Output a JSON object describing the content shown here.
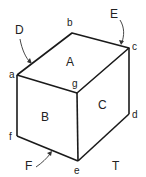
{
  "diagram": {
    "type": "isometric-box",
    "vertices": [
      {
        "id": "a",
        "label": "a",
        "x": 17,
        "y": 75
      },
      {
        "id": "b",
        "label": "b",
        "x": 72,
        "y": 33
      },
      {
        "id": "c",
        "label": "c",
        "x": 129,
        "y": 48
      },
      {
        "id": "d",
        "label": "d",
        "x": 129,
        "y": 114
      },
      {
        "id": "e",
        "label": "e",
        "x": 78,
        "y": 161
      },
      {
        "id": "f",
        "label": "f",
        "x": 17,
        "y": 136
      },
      {
        "id": "g",
        "label": "g",
        "x": 77,
        "y": 93
      }
    ],
    "faces": [
      {
        "id": "A",
        "label": "A",
        "position": "top"
      },
      {
        "id": "B",
        "label": "B",
        "position": "front-left"
      },
      {
        "id": "C",
        "label": "C",
        "position": "front-right"
      }
    ],
    "pointers": [
      {
        "id": "D",
        "label": "D",
        "target_edge": "a-b"
      },
      {
        "id": "E",
        "label": "E",
        "target_edge": "b-c"
      },
      {
        "id": "F",
        "label": "F",
        "target_edge": "f-e"
      }
    ],
    "extra_labels": [
      {
        "id": "T",
        "label": "T"
      }
    ]
  }
}
